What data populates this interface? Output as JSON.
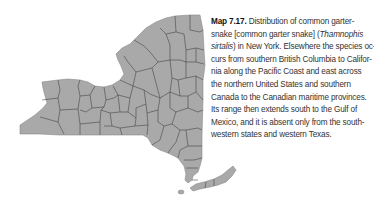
{
  "map": {
    "region": "New York",
    "fill_color": "#a9a9a9",
    "border_color": "#3a3a3a"
  },
  "caption": {
    "label": "Map 7.17.",
    "lines": [
      {
        "pre": " Distribution of common garter-",
        "ital": "",
        "post": ""
      },
      {
        "pre": "snake [common garter snake] (",
        "ital": "Thamnophis",
        "post": ""
      },
      {
        "pre": "",
        "ital": "sirtalis",
        "post": ") in New York. Elsewhere the species oc-"
      },
      {
        "pre": "curs from southern British Columbia to Califor-",
        "ital": "",
        "post": ""
      },
      {
        "pre": "nia along the Pacific Coast and east across",
        "ital": "",
        "post": ""
      },
      {
        "pre": "the northern United States and southern",
        "ital": "",
        "post": ""
      },
      {
        "pre": "Canada to the Canadian maritime provinces.",
        "ital": "",
        "post": ""
      },
      {
        "pre": "Its range then extends south to the Gulf of",
        "ital": "",
        "post": ""
      },
      {
        "pre": "Mexico, and it is absent only from the south-",
        "ital": "",
        "post": ""
      },
      {
        "pre": "western states and western Texas.",
        "ital": "",
        "post": ""
      }
    ]
  }
}
